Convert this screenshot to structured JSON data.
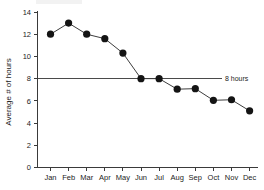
{
  "chart_data": {
    "type": "line",
    "title": "",
    "xlabel": "",
    "ylabel": "Average # of hours",
    "categories": [
      "Jan",
      "Feb",
      "Mar",
      "Apr",
      "May",
      "Jun",
      "Jul",
      "Aug",
      "Sep",
      "Oct",
      "Nov",
      "Dec"
    ],
    "values": [
      12.0,
      13.0,
      12.0,
      11.6,
      10.3,
      8.0,
      8.0,
      7.05,
      7.1,
      6.05,
      6.1,
      5.1
    ],
    "series": [
      {
        "name": "Average # of hours",
        "values": [
          12.0,
          13.0,
          12.0,
          11.6,
          10.3,
          8.0,
          8.0,
          7.05,
          7.1,
          6.05,
          6.1,
          5.1
        ]
      }
    ],
    "ylim": [
      0,
      14
    ],
    "yticks": [
      0,
      2,
      4,
      6,
      8,
      10,
      12,
      14
    ],
    "ytick_labels": [
      "0",
      "2",
      "4",
      "6",
      "8",
      "10",
      "12",
      "14"
    ],
    "grid": false,
    "legend": "none",
    "marker": "filled-circle",
    "line_color": "#3d3d3d",
    "marker_color": "#141414",
    "annotations": [
      {
        "name": "threshold-8-hours",
        "label": "8 hours",
        "y_value": 8,
        "type": "horizontal-reference-line",
        "color": "#4a4a4a"
      }
    ]
  },
  "axis": {
    "y_title": "Average # of hours",
    "y_tick_0": "0",
    "y_tick_2": "2",
    "y_tick_4": "4",
    "y_tick_6": "6",
    "y_tick_8": "8",
    "y_tick_10": "10",
    "y_tick_12": "12",
    "y_tick_14": "14",
    "x_tick_jan": "Jan",
    "x_tick_feb": "Feb",
    "x_tick_mar": "Mar",
    "x_tick_apr": "Apr",
    "x_tick_may": "May",
    "x_tick_jun": "Jun",
    "x_tick_jul": "Jul",
    "x_tick_aug": "Aug",
    "x_tick_sep": "Sep",
    "x_tick_oct": "Oct",
    "x_tick_nov": "Nov",
    "x_tick_dec": "Dec"
  },
  "annotation": {
    "threshold_label": "8 hours"
  }
}
